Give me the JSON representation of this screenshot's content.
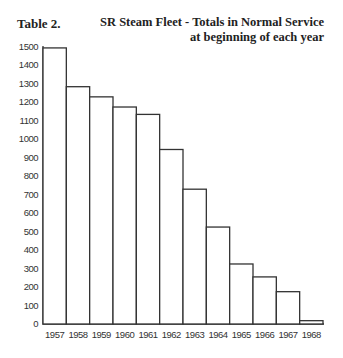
{
  "header": {
    "table_label": "Table 2.",
    "title_line1": "SR Steam Fleet - Totals in Normal Service",
    "title_line2": "at beginning of each year"
  },
  "chart_data": {
    "type": "bar",
    "title": "SR Steam Fleet - Totals in Normal Service at beginning of each year",
    "xlabel": "",
    "ylabel": "",
    "categories": [
      "1957",
      "1958",
      "1959",
      "1960",
      "1961",
      "1962",
      "1963",
      "1964",
      "1965",
      "1966",
      "1967",
      "1968"
    ],
    "values": [
      1495,
      1285,
      1230,
      1175,
      1135,
      945,
      730,
      525,
      325,
      255,
      175,
      18
    ],
    "ylim": [
      0,
      1500
    ],
    "yticks": [
      0,
      100,
      200,
      300,
      400,
      500,
      600,
      700,
      800,
      900,
      1000,
      1100,
      1200,
      1300,
      1400,
      1500
    ],
    "grid": false,
    "legend": null,
    "bar_fill": "#ffffff",
    "bar_stroke": "#333333"
  }
}
